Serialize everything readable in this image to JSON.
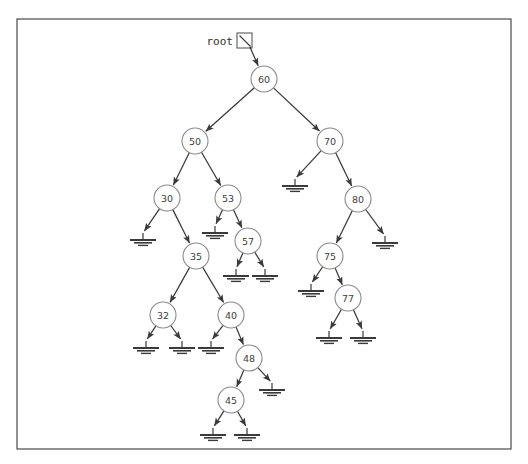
{
  "figure": {
    "background_color": "#ffffff",
    "frame": {
      "x": 17,
      "y": 19,
      "width": 494,
      "height": 430,
      "stroke_color": "#4a4a4a"
    }
  },
  "root_pointer": {
    "label": "root",
    "label_x": 233,
    "label_y": 41,
    "box_x": 237,
    "box_y": 33,
    "box_size": 15,
    "target_node": "60"
  },
  "style": {
    "node_fill": "#ffffff",
    "node_stroke": "#8a8a8a",
    "node_radius": 13,
    "label_color": "#3d3d3d",
    "edge_color": "#3a3a3a",
    "null_color": "#3a3a3a"
  },
  "chart_data": {
    "type": "diagram",
    "subtype": "binary-search-tree",
    "node_count": 14,
    "null_count": 15,
    "root": "60",
    "values": [
      60,
      50,
      70,
      30,
      53,
      80,
      35,
      57,
      75,
      32,
      40,
      77,
      48,
      45
    ],
    "inorder": [
      30,
      32,
      35,
      40,
      45,
      48,
      50,
      53,
      57,
      60,
      70,
      75,
      77,
      80
    ],
    "nodes": [
      {
        "id": "n60",
        "label": "60",
        "x": 264,
        "y": 79,
        "depth": 0,
        "left": "n50",
        "right": "n70"
      },
      {
        "id": "n50",
        "label": "50",
        "x": 195,
        "y": 141,
        "depth": 1,
        "left": "n30",
        "right": "n53"
      },
      {
        "id": "n70",
        "label": "70",
        "x": 330,
        "y": 141,
        "depth": 1,
        "left": null,
        "right": "n80"
      },
      {
        "id": "n30",
        "label": "30",
        "x": 167,
        "y": 198,
        "depth": 2,
        "left": null,
        "right": "n35"
      },
      {
        "id": "n53",
        "label": "53",
        "x": 228,
        "y": 198,
        "depth": 2,
        "left": null,
        "right": "n57"
      },
      {
        "id": "n80",
        "label": "80",
        "x": 358,
        "y": 199,
        "depth": 2,
        "left": "n75",
        "right": null
      },
      {
        "id": "n57",
        "label": "57",
        "x": 248,
        "y": 241,
        "depth": 3,
        "left": null,
        "right": null
      },
      {
        "id": "n35",
        "label": "35",
        "x": 196,
        "y": 256,
        "depth": 3,
        "left": "n32",
        "right": "n40"
      },
      {
        "id": "n75",
        "label": "75",
        "x": 330,
        "y": 256,
        "depth": 3,
        "left": null,
        "right": "n77"
      },
      {
        "id": "n77",
        "label": "77",
        "x": 348,
        "y": 298,
        "depth": 4,
        "left": null,
        "right": null
      },
      {
        "id": "n32",
        "label": "32",
        "x": 163,
        "y": 315,
        "depth": 4,
        "left": null,
        "right": null
      },
      {
        "id": "n40",
        "label": "40",
        "x": 231,
        "y": 315,
        "depth": 4,
        "left": null,
        "right": "n48"
      },
      {
        "id": "n48",
        "label": "48",
        "x": 249,
        "y": 358,
        "depth": 5,
        "left": "n45",
        "right": null
      },
      {
        "id": "n45",
        "label": "45",
        "x": 231,
        "y": 400,
        "depth": 6,
        "left": null,
        "right": null
      }
    ],
    "nulls": [
      {
        "id": "u70l",
        "parent": "n70",
        "side": "left",
        "x": 295,
        "y": 186
      },
      {
        "id": "u30l",
        "parent": "n30",
        "side": "left",
        "x": 143,
        "y": 240
      },
      {
        "id": "u53l",
        "parent": "n53",
        "side": "left",
        "x": 215,
        "y": 233
      },
      {
        "id": "u80r",
        "parent": "n80",
        "side": "right",
        "x": 385,
        "y": 243
      },
      {
        "id": "u57l",
        "parent": "n57",
        "side": "left",
        "x": 236,
        "y": 276
      },
      {
        "id": "u57r",
        "parent": "n57",
        "side": "right",
        "x": 265,
        "y": 276
      },
      {
        "id": "u75l",
        "parent": "n75",
        "side": "left",
        "x": 311,
        "y": 291
      },
      {
        "id": "u77l",
        "parent": "n77",
        "side": "left",
        "x": 329,
        "y": 338
      },
      {
        "id": "u77r",
        "parent": "n77",
        "side": "right",
        "x": 363,
        "y": 338
      },
      {
        "id": "u32l",
        "parent": "n32",
        "side": "left",
        "x": 146,
        "y": 348
      },
      {
        "id": "u32r",
        "parent": "n32",
        "side": "right",
        "x": 182,
        "y": 348
      },
      {
        "id": "u40l",
        "parent": "n40",
        "side": "left",
        "x": 211,
        "y": 348
      },
      {
        "id": "u48r",
        "parent": "n48",
        "side": "right",
        "x": 272,
        "y": 390
      },
      {
        "id": "u45l",
        "parent": "n45",
        "side": "left",
        "x": 213,
        "y": 435
      },
      {
        "id": "u45r",
        "parent": "n45",
        "side": "right",
        "x": 247,
        "y": 435
      }
    ]
  }
}
